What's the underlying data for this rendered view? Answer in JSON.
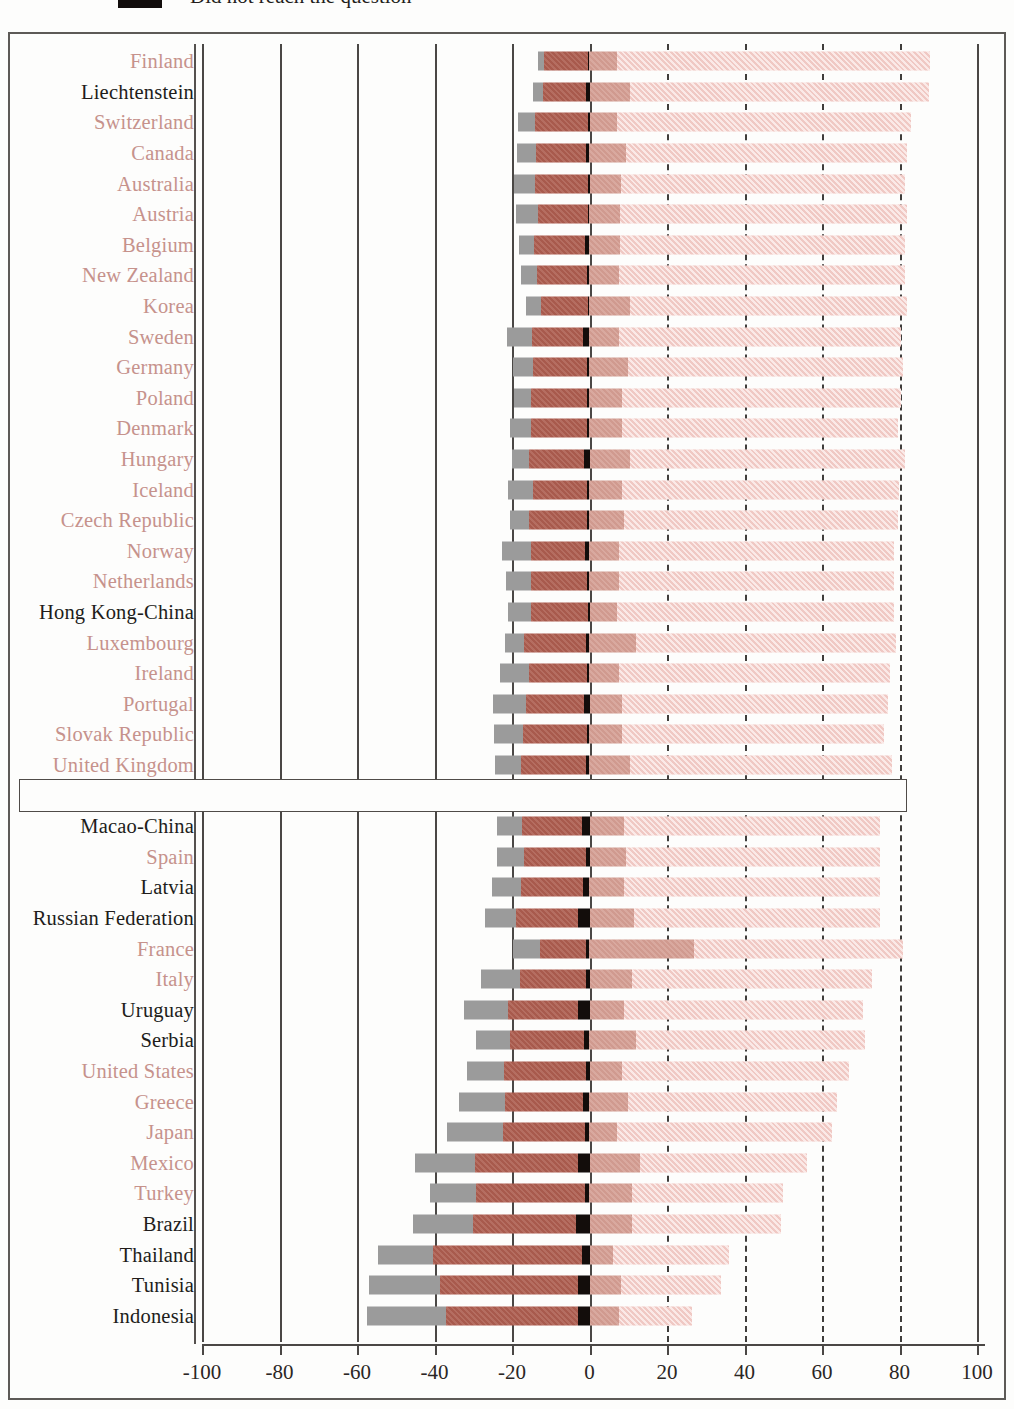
{
  "legend": {
    "swatch_color": "#120d0c",
    "label": "Did not reach the question"
  },
  "axis": {
    "ticks": [
      -100,
      -80,
      -60,
      -40,
      -20,
      0,
      20,
      40,
      60,
      80,
      100
    ],
    "tick_labels": [
      "-100",
      "-80",
      "-60",
      "-40",
      "-20",
      "0",
      "20",
      "40",
      "60",
      "80",
      "100"
    ],
    "min": -100,
    "max": 100,
    "step": 20
  },
  "series_colors": {
    "gray": "#9b9b9b",
    "dark_brown": "#ad5d4f",
    "black": "#130d0b",
    "mid_salmon": "#d49d92",
    "light_pink": "#f7d7d3"
  },
  "label_colors": {
    "oecd_member": "#c6928c",
    "partner": "#211c1a",
    "average": "#16120f"
  },
  "chart_data": {
    "type": "bar",
    "orientation": "horizontal",
    "stacking": "diverging-stacked",
    "title": "",
    "subtitle": "",
    "xlabel": "",
    "ylabel": "",
    "xlim": [
      -100,
      100
    ],
    "grid": true,
    "legend_position": "above-plot",
    "series": [
      {
        "name": "gray",
        "color": "#9b9b9b",
        "side": "negative"
      },
      {
        "name": "dark_brown",
        "color": "#ad5d4f",
        "side": "negative"
      },
      {
        "name": "black",
        "color": "#130d0b",
        "side": "negative"
      },
      {
        "name": "mid_salmon",
        "color": "#d49d92",
        "side": "positive"
      },
      {
        "name": "light_pink",
        "color": "#f7d7d3",
        "side": "positive"
      }
    ],
    "categories": [
      "Finland",
      "Liechtenstein",
      "Switzerland",
      "Canada",
      "Australia",
      "Austria",
      "Belgium",
      "New Zealand",
      "Korea",
      "Sweden",
      "Germany",
      "Poland",
      "Denmark",
      "Hungary",
      "Iceland",
      "Czech Republic",
      "Norway",
      "Netherlands",
      "Hong Kong-China",
      "Luxembourg",
      "Ireland",
      "Portugal",
      "Slovak Republic",
      "United Kingdom",
      "OECD average",
      "Macao-China",
      "Spain",
      "Latvia",
      "Russian Federation",
      "France",
      "Italy",
      "Uruguay",
      "Serbia",
      "United States",
      "Greece",
      "Japan",
      "Mexico",
      "Turkey",
      "Brazil",
      "Thailand",
      "Tunisia",
      "Indonesia"
    ],
    "rows": [
      {
        "label": "Finland",
        "kind": "oecd-member",
        "gray": 1.5,
        "dark": 11.5,
        "black": 0.3,
        "mid": 7.0,
        "light": 81.0
      },
      {
        "label": "Liechtenstein",
        "kind": "partner",
        "gray": 2.5,
        "dark": 11.0,
        "black": 1.0,
        "mid": 10.5,
        "light": 77.0
      },
      {
        "label": "Switzerland",
        "kind": "oecd-member",
        "gray": 4.5,
        "dark": 13.5,
        "black": 0.5,
        "mid": 7.0,
        "light": 76.0
      },
      {
        "label": "Canada",
        "kind": "oecd-member",
        "gray": 5.0,
        "dark": 13.0,
        "black": 0.8,
        "mid": 9.5,
        "light": 72.5
      },
      {
        "label": "Australia",
        "kind": "oecd-member",
        "gray": 5.5,
        "dark": 13.5,
        "black": 0.5,
        "mid": 8.0,
        "light": 73.5
      },
      {
        "label": "Austria",
        "kind": "oecd-member",
        "gray": 5.5,
        "dark": 13.0,
        "black": 0.4,
        "mid": 8.0,
        "light": 74.0
      },
      {
        "label": "Belgium",
        "kind": "oecd-member",
        "gray": 4.0,
        "dark": 13.0,
        "black": 1.2,
        "mid": 8.0,
        "light": 73.5
      },
      {
        "label": "New Zealand",
        "kind": "oecd-member",
        "gray": 4.0,
        "dark": 13.0,
        "black": 0.6,
        "mid": 7.5,
        "light": 74.0
      },
      {
        "label": "Korea",
        "kind": "oecd-member",
        "gray": 4.0,
        "dark": 12.0,
        "black": 0.4,
        "mid": 10.5,
        "light": 71.5
      },
      {
        "label": "Sweden",
        "kind": "oecd-member",
        "gray": 6.5,
        "dark": 13.0,
        "black": 1.8,
        "mid": 7.5,
        "light": 73.0
      },
      {
        "label": "Germany",
        "kind": "oecd-member",
        "gray": 5.0,
        "dark": 14.0,
        "black": 0.7,
        "mid": 10.0,
        "light": 71.0
      },
      {
        "label": "Poland",
        "kind": "oecd-member",
        "gray": 4.5,
        "dark": 14.5,
        "black": 0.6,
        "mid": 8.5,
        "light": 72.0
      },
      {
        "label": "Denmark",
        "kind": "oecd-member",
        "gray": 5.5,
        "dark": 14.5,
        "black": 0.6,
        "mid": 8.5,
        "light": 71.0
      },
      {
        "label": "Hungary",
        "kind": "oecd-member",
        "gray": 4.5,
        "dark": 14.0,
        "black": 1.5,
        "mid": 10.5,
        "light": 71.0
      },
      {
        "label": "Iceland",
        "kind": "oecd-member",
        "gray": 6.5,
        "dark": 14.0,
        "black": 0.6,
        "mid": 8.5,
        "light": 71.5
      },
      {
        "label": "Czech Republic",
        "kind": "oecd-member",
        "gray": 5.0,
        "dark": 15.0,
        "black": 0.6,
        "mid": 9.0,
        "light": 70.5
      },
      {
        "label": "Norway",
        "kind": "oecd-member",
        "gray": 7.5,
        "dark": 14.0,
        "black": 1.2,
        "mid": 7.5,
        "light": 71.0
      },
      {
        "label": "Netherlands",
        "kind": "oecd-member",
        "gray": 6.5,
        "dark": 14.5,
        "black": 0.6,
        "mid": 7.5,
        "light": 71.0
      },
      {
        "label": "Hong Kong-China",
        "kind": "partner",
        "gray": 6.0,
        "dark": 14.5,
        "black": 0.5,
        "mid": 7.0,
        "light": 71.5
      },
      {
        "label": "Luxembourg",
        "kind": "oecd-member",
        "gray": 5.0,
        "dark": 16.0,
        "black": 0.8,
        "mid": 12.0,
        "light": 67.0
      },
      {
        "label": "Ireland",
        "kind": "oecd-member",
        "gray": 7.5,
        "dark": 15.0,
        "black": 0.6,
        "mid": 7.5,
        "light": 70.0
      },
      {
        "label": "Portugal",
        "kind": "oecd-member",
        "gray": 8.5,
        "dark": 15.0,
        "black": 1.5,
        "mid": 8.5,
        "light": 68.5
      },
      {
        "label": "Slovak Republic",
        "kind": "oecd-member",
        "gray": 7.5,
        "dark": 16.5,
        "black": 0.7,
        "mid": 8.5,
        "light": 67.5
      },
      {
        "label": "United Kingdom",
        "kind": "oecd-member",
        "gray": 6.5,
        "dark": 17.0,
        "black": 0.8,
        "mid": 10.5,
        "light": 67.5
      },
      {
        "label": "OECD average",
        "kind": "average",
        "gray": 6.5,
        "dark": 16.0,
        "black": 1.0,
        "mid": 9.5,
        "light": 67.0
      },
      {
        "label": "Macao-China",
        "kind": "partner",
        "gray": 6.5,
        "dark": 15.5,
        "black": 2.0,
        "mid": 9.0,
        "light": 66.0
      },
      {
        "label": "Spain",
        "kind": "oecd-member",
        "gray": 7.0,
        "dark": 16.0,
        "black": 1.0,
        "mid": 9.5,
        "light": 65.5
      },
      {
        "label": "Latvia",
        "kind": "partner",
        "gray": 7.5,
        "dark": 16.0,
        "black": 1.6,
        "mid": 9.0,
        "light": 66.0
      },
      {
        "label": "Russian Federation",
        "kind": "partner",
        "gray": 8.0,
        "dark": 16.0,
        "black": 3.0,
        "mid": 11.5,
        "light": 63.5
      },
      {
        "label": "France",
        "kind": "oecd-member",
        "gray": 7.0,
        "dark": 12.0,
        "black": 0.8,
        "mid": 27.0,
        "light": 54.0
      },
      {
        "label": "Italy",
        "kind": "oecd-member",
        "gray": 10.0,
        "dark": 17.0,
        "black": 1.0,
        "mid": 11.0,
        "light": 62.0
      },
      {
        "label": "Uruguay",
        "kind": "partner",
        "gray": 11.5,
        "dark": 18.0,
        "black": 3.0,
        "mid": 9.0,
        "light": 61.5
      },
      {
        "label": "Serbia",
        "kind": "partner",
        "gray": 9.0,
        "dark": 19.0,
        "black": 1.4,
        "mid": 12.0,
        "light": 59.0
      },
      {
        "label": "United States",
        "kind": "oecd-member",
        "gray": 9.5,
        "dark": 21.0,
        "black": 1.0,
        "mid": 8.5,
        "light": 58.5
      },
      {
        "label": "Greece",
        "kind": "oecd-member",
        "gray": 12.0,
        "dark": 20.0,
        "black": 1.8,
        "mid": 10.0,
        "light": 54.0
      },
      {
        "label": "Japan",
        "kind": "oecd-member",
        "gray": 14.5,
        "dark": 21.0,
        "black": 1.2,
        "mid": 7.0,
        "light": 55.5
      },
      {
        "label": "Mexico",
        "kind": "oecd-member",
        "gray": 15.5,
        "dark": 26.5,
        "black": 3.0,
        "mid": 13.0,
        "light": 43.0
      },
      {
        "label": "Turkey",
        "kind": "oecd-member",
        "gray": 12.0,
        "dark": 28.0,
        "black": 1.2,
        "mid": 11.0,
        "light": 39.0
      },
      {
        "label": "Brazil",
        "kind": "partner",
        "gray": 15.5,
        "dark": 26.5,
        "black": 3.5,
        "mid": 11.0,
        "light": 38.5
      },
      {
        "label": "Thailand",
        "kind": "partner",
        "gray": 14.0,
        "dark": 38.5,
        "black": 2.0,
        "mid": 6.0,
        "light": 30.0
      },
      {
        "label": "Tunisia",
        "kind": "partner",
        "gray": 18.5,
        "dark": 35.5,
        "black": 3.0,
        "mid": 8.0,
        "light": 26.0
      },
      {
        "label": "Indonesia",
        "kind": "partner",
        "gray": 20.5,
        "dark": 34.0,
        "black": 3.0,
        "mid": 7.5,
        "light": 19.0
      }
    ]
  }
}
